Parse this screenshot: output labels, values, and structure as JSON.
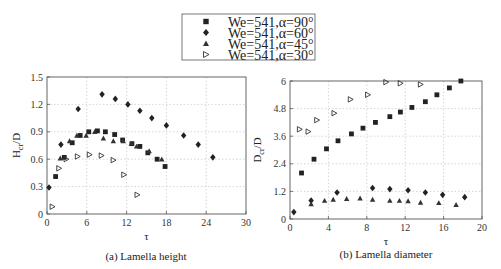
{
  "legend": [
    {
      "label": "We=541,α=90°",
      "marker": "square"
    },
    {
      "label": "We=541,α=60°",
      "marker": "diamond"
    },
    {
      "label": "We=541,α=45°",
      "marker": "triangle-up"
    },
    {
      "label": "We=541,α=30°",
      "marker": "triangle-right"
    }
  ],
  "chart_data": [
    {
      "type": "scatter",
      "title": "(a) Lamella height",
      "xlabel": "τ",
      "ylabel": "H_cr/D",
      "xlim": [
        0,
        30
      ],
      "ylim": [
        0,
        1.5
      ],
      "xticks": [
        0,
        6,
        12,
        18,
        24,
        30
      ],
      "yticks": [
        0,
        0.3,
        0.6,
        0.9,
        1.2,
        1.5
      ],
      "grid": true,
      "series": [
        {
          "name": "We=541,α=90°",
          "marker": "square",
          "x": [
            1.3,
            2.6,
            3.8,
            5.0,
            6.3,
            7.6,
            8.8,
            10.2,
            11.4,
            12.8,
            14.0,
            15.2,
            16.6,
            17.8
          ],
          "y": [
            0.41,
            0.62,
            0.78,
            0.86,
            0.9,
            0.91,
            0.9,
            0.87,
            0.81,
            0.77,
            0.74,
            0.67,
            0.6,
            0.52
          ]
        },
        {
          "name": "We=541,α=60°",
          "marker": "diamond",
          "x": [
            0.3,
            2.1,
            4.7,
            8.3,
            10.3,
            12.2,
            14.0,
            15.8,
            18.0,
            20.6,
            22.8,
            25.0
          ],
          "y": [
            0.29,
            0.76,
            1.15,
            1.31,
            1.26,
            1.2,
            1.13,
            1.05,
            0.97,
            0.86,
            0.76,
            0.62
          ]
        },
        {
          "name": "We=541,α=45°",
          "marker": "triangle-up",
          "x": [
            2.0,
            3.4,
            4.5,
            5.9,
            7.2,
            8.5,
            10.0,
            11.5,
            12.7,
            13.5,
            15.4,
            17.3
          ],
          "y": [
            0.61,
            0.8,
            0.86,
            0.86,
            0.9,
            0.83,
            0.8,
            0.8,
            0.77,
            0.74,
            0.69,
            0.6
          ]
        },
        {
          "name": "We=541,α=30°",
          "marker": "triangle-right",
          "x": [
            0.8,
            1.8,
            2.9,
            4.6,
            6.4,
            8.2,
            10.0,
            11.6,
            13.6
          ],
          "y": [
            0.08,
            0.5,
            0.6,
            0.63,
            0.65,
            0.64,
            0.59,
            0.43,
            0.21
          ]
        }
      ]
    },
    {
      "type": "scatter",
      "title": "(b) Lamella diameter",
      "xlabel": "τ",
      "ylabel": "D_cr/D",
      "xlim": [
        0,
        20
      ],
      "ylim": [
        0,
        6
      ],
      "xticks": [
        0,
        4,
        8,
        12,
        16,
        20
      ],
      "yticks": [
        0,
        1.2,
        2.4,
        3.6,
        4.8,
        6
      ],
      "grid": true,
      "series": [
        {
          "name": "We=541,α=90°",
          "marker": "square",
          "x": [
            1.2,
            2.5,
            3.8,
            5.0,
            6.4,
            7.6,
            8.9,
            10.4,
            11.5,
            12.7,
            14.1,
            15.3,
            16.6,
            17.8
          ],
          "y": [
            2.0,
            2.6,
            3.05,
            3.4,
            3.7,
            3.95,
            4.2,
            4.45,
            4.65,
            4.85,
            5.1,
            5.4,
            5.7,
            6.0
          ]
        },
        {
          "name": "We=541,α=60°",
          "marker": "diamond",
          "x": [
            0.4,
            2.2,
            4.9,
            8.6,
            10.4,
            12.3,
            14.1,
            15.9,
            18.2
          ],
          "y": [
            0.3,
            0.8,
            1.15,
            1.35,
            1.3,
            1.25,
            1.15,
            1.05,
            0.95
          ]
        },
        {
          "name": "We=541,α=45°",
          "marker": "triangle-up",
          "x": [
            2.2,
            3.6,
            4.5,
            5.9,
            7.3,
            8.6,
            10.4,
            11.4,
            12.3,
            13.6,
            15.5,
            17.3
          ],
          "y": [
            0.65,
            0.8,
            0.85,
            0.88,
            0.9,
            0.85,
            0.8,
            0.8,
            0.78,
            0.72,
            0.7,
            0.62
          ]
        },
        {
          "name": "We=541,α=30°",
          "marker": "triangle-right",
          "x": [
            1.0,
            1.9,
            2.8,
            4.6,
            6.3,
            8.1,
            10.0,
            11.5,
            13.6
          ],
          "y": [
            3.9,
            3.8,
            4.3,
            4.6,
            5.2,
            5.4,
            5.95,
            5.9,
            5.85
          ]
        }
      ]
    }
  ]
}
